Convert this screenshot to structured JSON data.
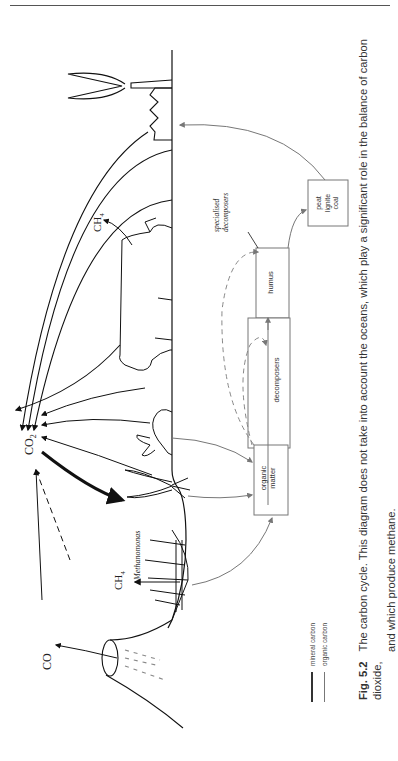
{
  "figure": {
    "number": "Fig. 5.2",
    "caption_line1": "The carbon cycle. This diagram does not take into account the oceans, which play a significant role in the balance of carbon dioxide,",
    "caption_line2": "and which produce methane."
  },
  "labels": {
    "co2": "CO",
    "co2_sub": "2",
    "co": "CO",
    "ch4_cow": "CH",
    "ch4_cow_sub": "4",
    "ch4_bog": "CH",
    "ch4_bog_sub": "4",
    "methanomonas": "Methanomonas",
    "specialised": "specialised",
    "decomposers_specialised": "decomposers"
  },
  "boxes": {
    "organic_line1": "organic",
    "organic_line2": "matter",
    "decomposers": "decomposers",
    "humus": "humus",
    "peat": "peat",
    "lignite": "lignite",
    "coal": "coal"
  },
  "legend": {
    "mineral": "mineral carbon",
    "organic": "organic carbon"
  },
  "colors": {
    "mineral_line": "#222222",
    "organic_line": "#777777",
    "box_border": "#777777"
  }
}
